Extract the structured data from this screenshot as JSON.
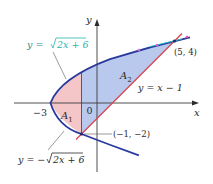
{
  "figure": {
    "type": "area-between-curves",
    "origin_px": [
      97,
      103
    ],
    "scale_px_per_unit": 15.5,
    "colors": {
      "region_A1": "#f4c6c8",
      "region_A2": "#b9c9ee",
      "parabola": "#2a3a9c",
      "line": "#d9434f",
      "axis": "#3a3a3a",
      "label_highlight": "#27b3b0"
    }
  },
  "axes": {
    "x_label": "x",
    "y_label": "y",
    "origin_label": "0",
    "x_tick_label": "−3"
  },
  "curves": {
    "upper": {
      "label_prefix": "y = ",
      "label_radical": "2x + 6",
      "equation": "y = √(2x + 6)"
    },
    "lower": {
      "label_prefix": "y = −",
      "label_radical": "2x + 6",
      "equation": "y = −√(2x + 6)"
    },
    "line": {
      "label": "y = x − 1"
    }
  },
  "regions": {
    "A1": {
      "label": "A",
      "sub": "1"
    },
    "A2": {
      "label": "A",
      "sub": "2"
    }
  },
  "points": {
    "p1": {
      "label": "(5, 4)",
      "x": 5,
      "y": 4
    },
    "p2": {
      "label": "(−1, −2)",
      "x": -1,
      "y": -2
    }
  }
}
